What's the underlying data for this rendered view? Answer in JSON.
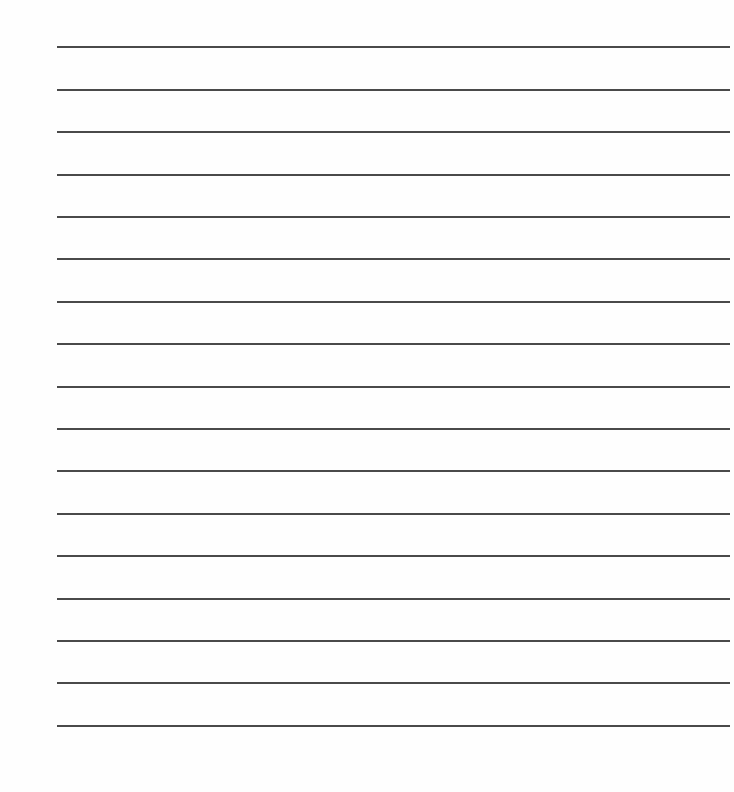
{
  "page": {
    "type": "lined-writing-paper",
    "background_color": "#fefefe",
    "line_color": "#4a4a4a",
    "line_count": 17,
    "line_left": 57,
    "line_right": 730,
    "line_thickness": 1.6,
    "line_positions_y": [
      46,
      89,
      131,
      174,
      216,
      258,
      301,
      343,
      386,
      428,
      470,
      513,
      555,
      598,
      640,
      682,
      725
    ]
  }
}
